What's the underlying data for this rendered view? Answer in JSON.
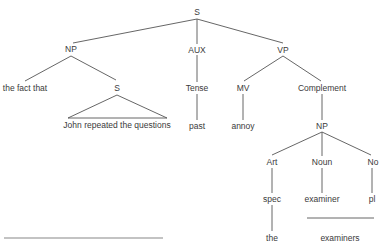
{
  "diagram": {
    "type": "syntax-tree",
    "stroke_color": "#555555",
    "text_color": "#3a3a3a",
    "nodes": {
      "root_s": "S",
      "np": "NP",
      "aux": "AUX",
      "vp": "VP",
      "the_fact_that": "the fact that",
      "embedded_s": "S",
      "embedded_s_text": "John repeated the questions",
      "tense": "Tense",
      "past": "past",
      "mv": "MV",
      "annoy": "annoy",
      "complement": "Complement",
      "np2": "NP",
      "art": "Art",
      "noun": "Noun",
      "number": "No",
      "spec": "spec",
      "examiner": "examiner",
      "pl": "pl",
      "the": "the",
      "examiners": "examiners"
    },
    "edges": [
      [
        "S",
        "NP"
      ],
      [
        "S",
        "AUX"
      ],
      [
        "S",
        "VP"
      ],
      [
        "NP",
        "the fact that"
      ],
      [
        "NP",
        "S"
      ],
      [
        "S",
        "John repeated the questions (triangle)"
      ],
      [
        "AUX",
        "Tense"
      ],
      [
        "Tense",
        "past"
      ],
      [
        "VP",
        "MV"
      ],
      [
        "VP",
        "Complement"
      ],
      [
        "MV",
        "annoy"
      ],
      [
        "Complement",
        "NP"
      ],
      [
        "NP",
        "Art"
      ],
      [
        "NP",
        "Noun"
      ],
      [
        "NP",
        "No"
      ],
      [
        "Art",
        "spec"
      ],
      [
        "spec",
        "the"
      ],
      [
        "Noun",
        "examiner"
      ],
      [
        "No",
        "pl"
      ]
    ]
  }
}
